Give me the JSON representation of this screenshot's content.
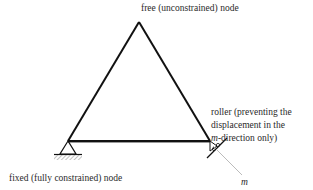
{
  "labels": {
    "free_node": "free (unconstrained) node",
    "roller_line1": "roller (preventing the",
    "roller_line2": "displacement in the",
    "roller_line3_var": "m",
    "roller_line3_rest": "-direction only)",
    "fixed_node": "fixed (fully constrained) node",
    "direction_symbol": "m"
  },
  "structure": {
    "type": "triangular truss",
    "nodes": [
      {
        "id": "top",
        "x": 139,
        "y": 22,
        "constraint": "free"
      },
      {
        "id": "left",
        "x": 68,
        "y": 141,
        "constraint": "fixed"
      },
      {
        "id": "right",
        "x": 210,
        "y": 141,
        "constraint": "roller"
      }
    ],
    "members": [
      [
        "left",
        "top"
      ],
      [
        "top",
        "right"
      ],
      [
        "left",
        "right"
      ]
    ]
  },
  "colors": {
    "line": "#111111",
    "hatch": "#999999",
    "axis": "#aaaaaa"
  }
}
